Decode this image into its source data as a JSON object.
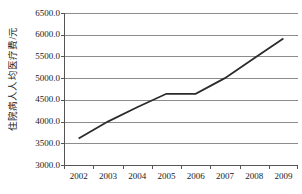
{
  "chart_data": {
    "type": "line",
    "title": "",
    "xlabel": "",
    "ylabel": "住院病人人均医疗费/元",
    "categories": [
      "2002",
      "2003",
      "2004",
      "2005",
      "2006",
      "2007",
      "2008",
      "2009"
    ],
    "values": [
      3610,
      4000,
      4330,
      4640,
      4640,
      5000,
      5460,
      5910
    ],
    "series": [
      {
        "name": "住院病人人均医疗费",
        "values": [
          3610,
          4000,
          4330,
          4640,
          4640,
          5000,
          5460,
          5910
        ]
      }
    ],
    "ylim": [
      3000,
      6500
    ],
    "ytick_labels": [
      "6500.0",
      "6000.0",
      "5500.0",
      "5000.0",
      "4500.0",
      "4000.0",
      "3500.0",
      "3000.0"
    ],
    "ytick_values": [
      6500,
      6000,
      5500,
      5000,
      4500,
      4000,
      3500,
      3000
    ],
    "grid": true,
    "legend": "none",
    "line_color": "#2b2b2b",
    "grid_color": "#8c8c8c",
    "axis_color": "#555555",
    "background": "#ffffff"
  }
}
